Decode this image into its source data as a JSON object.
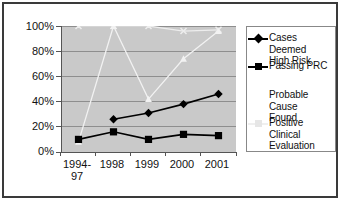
{
  "chart_data": {
    "type": "line",
    "title": "",
    "xlabel": "",
    "ylabel": "",
    "categories": [
      "1994-\n97",
      "1998",
      "1999",
      "2000",
      "2001"
    ],
    "ylim": [
      0,
      100
    ],
    "yticks": [
      "0%",
      "20%",
      "40%",
      "60%",
      "80%",
      "100%"
    ],
    "ytick_values": [
      0,
      20,
      40,
      60,
      80,
      100
    ],
    "grid": true,
    "legend_position": "right",
    "series": [
      {
        "name": "Cases Deemed High Risk",
        "marker": "diamond",
        "color": "#000000",
        "values": [
          null,
          26,
          31,
          38,
          46
        ]
      },
      {
        "name": "Passing PRC",
        "marker": "square",
        "color": "#000000",
        "values": [
          10,
          16,
          10,
          14,
          13
        ]
      },
      {
        "name": "Probable Cause Found",
        "marker": "triangle",
        "color": "#f2f2f2",
        "values": [
          8,
          100,
          42,
          74,
          96
        ]
      },
      {
        "name": "Positive Clinical Evaluation",
        "marker": "cross",
        "color": "#ededed",
        "values": [
          100,
          100,
          100,
          96,
          97
        ]
      }
    ]
  },
  "legend": {
    "items": [
      {
        "label": "Cases Deemed\nHigh Risk",
        "marker": "diamond",
        "color": "#000000"
      },
      {
        "label": "Passing PRC",
        "marker": "square",
        "color": "#000000"
      },
      {
        "label": "Probable Cause\nFound",
        "marker": "triangle",
        "color": "#ffffff"
      },
      {
        "label": "Positive Clinical\nEvaluation",
        "marker": "cross",
        "color": "#efefef"
      }
    ]
  },
  "colors": {
    "plot_background": "#c9c9c9",
    "frame_border": "#3a3a3a",
    "gridline": "#8e8e8e",
    "axis": "#555555",
    "text": "#111111"
  }
}
